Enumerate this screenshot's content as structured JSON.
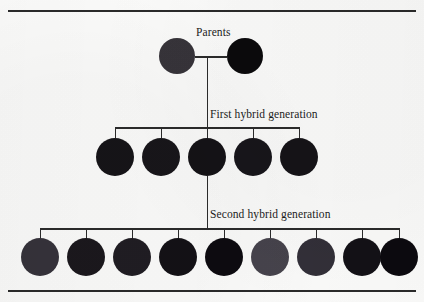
{
  "figure": {
    "background_color": "#fbfbfa",
    "rule_color": "#2a2a2a",
    "line_color": "#2b2b2b"
  },
  "labels": {
    "parents": "Parents",
    "first_generation": "First hybrid generation",
    "second_generation": "Second hybrid generation"
  },
  "chart_data": {
    "type": "diagram",
    "generations": [
      {
        "name": "Parents",
        "label": "Parents",
        "count": 2,
        "individuals": [
          {
            "index": 1,
            "shade": "dark-gray",
            "color": "#37343a",
            "cx": 177,
            "cy": 56,
            "r": 18
          },
          {
            "index": 2,
            "shade": "black",
            "color": "#0b0a0c",
            "cx": 245,
            "cy": 56,
            "r": 18
          }
        ]
      },
      {
        "name": "First hybrid generation",
        "label": "First hybrid generation",
        "count": 5,
        "individuals": [
          {
            "index": 1,
            "shade": "near-black",
            "color": "#161418",
            "cx": 115,
            "cy": 157,
            "r": 19
          },
          {
            "index": 2,
            "shade": "near-black",
            "color": "#18161a",
            "cx": 161,
            "cy": 157,
            "r": 19
          },
          {
            "index": 3,
            "shade": "near-black",
            "color": "#141216",
            "cx": 207,
            "cy": 157,
            "r": 19
          },
          {
            "index": 4,
            "shade": "near-black",
            "color": "#17151a",
            "cx": 253,
            "cy": 157,
            "r": 19
          },
          {
            "index": 5,
            "shade": "near-black",
            "color": "#151317",
            "cx": 299,
            "cy": 157,
            "r": 19
          }
        ]
      },
      {
        "name": "Second hybrid generation",
        "label": "Second hybrid generation",
        "count": 9,
        "individuals": [
          {
            "index": 1,
            "shade": "dark-gray",
            "color": "#35323a",
            "cx": 40,
            "cy": 257,
            "r": 19
          },
          {
            "index": 2,
            "shade": "very-dark",
            "color": "#1b181d",
            "cx": 86,
            "cy": 257,
            "r": 19
          },
          {
            "index": 3,
            "shade": "very-dark",
            "color": "#201d23",
            "cx": 132,
            "cy": 257,
            "r": 19
          },
          {
            "index": 4,
            "shade": "near-black",
            "color": "#131116",
            "cx": 178,
            "cy": 257,
            "r": 19
          },
          {
            "index": 5,
            "shade": "black",
            "color": "#0d0b10",
            "cx": 224,
            "cy": 257,
            "r": 19
          },
          {
            "index": 6,
            "shade": "medium-gray",
            "color": "#46434c",
            "cx": 270,
            "cy": 257,
            "r": 19
          },
          {
            "index": 7,
            "shade": "dark-gray",
            "color": "#322f38",
            "cx": 316,
            "cy": 257,
            "r": 19
          },
          {
            "index": 8,
            "shade": "near-black",
            "color": "#131116",
            "cx": 362,
            "cy": 257,
            "r": 19
          },
          {
            "index": 9,
            "shade": "black",
            "color": "#0c0a0f",
            "cx": 399,
            "cy": 257,
            "r": 19
          }
        ]
      }
    ],
    "connectors": {
      "parents_link": {
        "x1": 195,
        "x2": 227,
        "y": 56
      },
      "parents_to_f1": {
        "x": 207,
        "y1": 56,
        "y2": 127
      },
      "f1_bracket": {
        "x1": 115,
        "x2": 299,
        "y": 127,
        "ticks": [
          115,
          161,
          207,
          253,
          299
        ]
      },
      "f1_to_f2": {
        "x": 207,
        "y1": 176,
        "y2": 228
      },
      "f2_bracket": {
        "x1": 40,
        "x2": 399,
        "y": 228,
        "ticks": [
          40,
          86,
          132,
          178,
          224,
          270,
          316,
          362,
          399
        ]
      }
    }
  }
}
